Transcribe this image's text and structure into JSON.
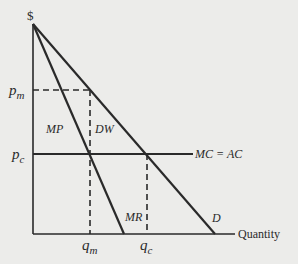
{
  "diagram": {
    "y_axis_label": "$",
    "x_axis_label": "Quantity",
    "price_labels": {
      "monopoly": {
        "base": "p",
        "sub": "m"
      },
      "competitive": {
        "base": "p",
        "sub": "c"
      }
    },
    "quantity_labels": {
      "monopoly": {
        "base": "q",
        "sub": "m"
      },
      "competitive": {
        "base": "q",
        "sub": "c"
      }
    },
    "curves": {
      "demand": "D",
      "marginal_revenue": "MR",
      "cost": "MC = AC"
    },
    "regions": {
      "monopoly_profit": "MP",
      "deadweight_loss": "DW"
    },
    "colors": {
      "line": "#2a2a2a",
      "background": "#ececea"
    }
  }
}
